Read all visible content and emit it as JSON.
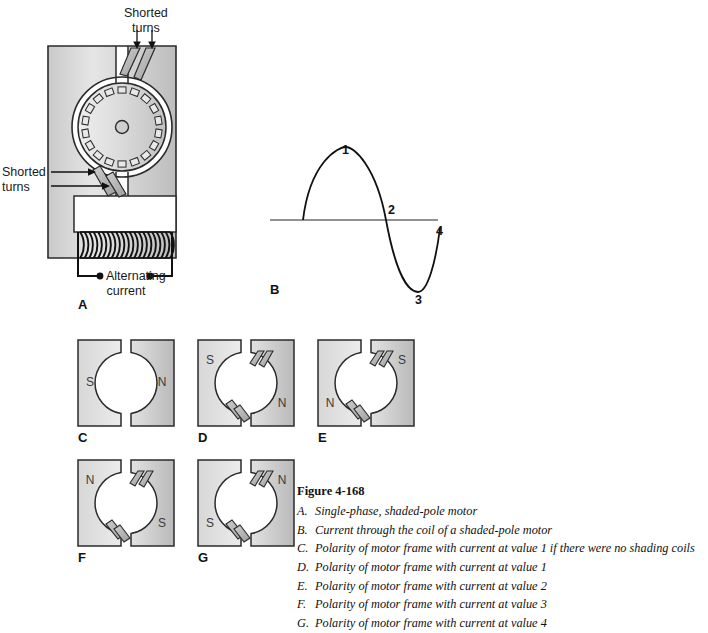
{
  "figure": {
    "title": "Figure 4-168",
    "items": [
      {
        "key": "A.",
        "text": "Single-phase, shaded-pole motor"
      },
      {
        "key": "B.",
        "text": "Current through the coil of a shaded-pole motor"
      },
      {
        "key": "C.",
        "text": "Polarity of motor frame with current at value 1 if there were no shading coils"
      },
      {
        "key": "D.",
        "text": "Polarity of motor frame with current at value 1"
      },
      {
        "key": "E.",
        "text": "Polarity of motor frame with current at value 2"
      },
      {
        "key": "F.",
        "text": "Polarity of motor frame with current at value 3"
      },
      {
        "key": "G.",
        "text": "Polarity of motor frame with current at value 4"
      }
    ]
  },
  "panel_a": {
    "letter": "A",
    "label_top": "Shorted\nturns",
    "label_top_line1": "Shorted",
    "label_top_line2": "turns",
    "label_left_line1": "Shorted",
    "label_left_line2": "turns",
    "label_supply_line1": "Alternating",
    "label_supply_line2": "current",
    "rotor_bar_count": 18,
    "coil_turn_count": 20
  },
  "panel_b": {
    "letter": "B",
    "markers": [
      "1",
      "2",
      "3",
      "4"
    ]
  },
  "frames": [
    {
      "letter": "C",
      "left_pole": "S",
      "right_pole": "N",
      "left_pole_position": "middle",
      "right_pole_position": "middle",
      "shading_coils": false
    },
    {
      "letter": "D",
      "left_pole": "S",
      "right_pole": "N",
      "left_pole_position": "top",
      "right_pole_position": "bottom",
      "shading_coils": true
    },
    {
      "letter": "E",
      "left_pole": "N",
      "right_pole": "S",
      "left_pole_position": "bottom",
      "right_pole_position": "top",
      "shading_coils": true
    },
    {
      "letter": "F",
      "left_pole": "N",
      "right_pole": "S",
      "left_pole_position": "top",
      "right_pole_position": "bottom",
      "shading_coils": true
    },
    {
      "letter": "G",
      "left_pole": "S",
      "right_pole": "N",
      "left_pole_position": "bottom",
      "right_pole_position": "top",
      "shading_coils": true
    }
  ],
  "chart_data": {
    "type": "line",
    "title": "",
    "xlabel": "",
    "ylabel": "",
    "series": [
      {
        "name": "Alternating current",
        "x": [
          0,
          0.25,
          0.5,
          0.75,
          1.0
        ],
        "values": [
          0,
          1,
          0,
          -1,
          0
        ]
      }
    ],
    "annotations": [
      {
        "label": "1",
        "x": 0.25,
        "y": 1
      },
      {
        "label": "2",
        "x": 0.5,
        "y": 0
      },
      {
        "label": "3",
        "x": 0.75,
        "y": -1
      },
      {
        "label": "4",
        "x": 1.0,
        "y": 0
      }
    ],
    "ylim": [
      -1.2,
      1.2
    ],
    "grid": false,
    "legend": false
  },
  "colors": {
    "frame_fill_light": "#e2e2e2",
    "frame_fill_dark": "#c4c4c4",
    "outline": "#2b2b2b",
    "shading_bar": "#b0b0b0",
    "text": "#111111"
  }
}
